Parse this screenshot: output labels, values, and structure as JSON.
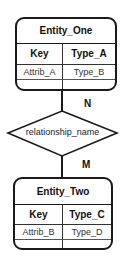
{
  "entities": [
    {
      "title": "Entity_One",
      "header": [
        "Key",
        "Type_A"
      ],
      "rows": [
        [
          "Attrib_A",
          "Type_B"
        ],
        [
          "",
          ""
        ]
      ]
    },
    {
      "title": "Entity_Two",
      "header": [
        "Key",
        "Type_C"
      ],
      "rows": [
        [
          "Attrib_B",
          "Type_D"
        ],
        [
          "",
          ""
        ]
      ]
    }
  ],
  "relationship": {
    "name": "relationship_name",
    "cardinality_top": "N",
    "cardinality_bottom": "M"
  },
  "colors": {
    "stroke": "#1a1a1a",
    "background": "#ffffff"
  }
}
